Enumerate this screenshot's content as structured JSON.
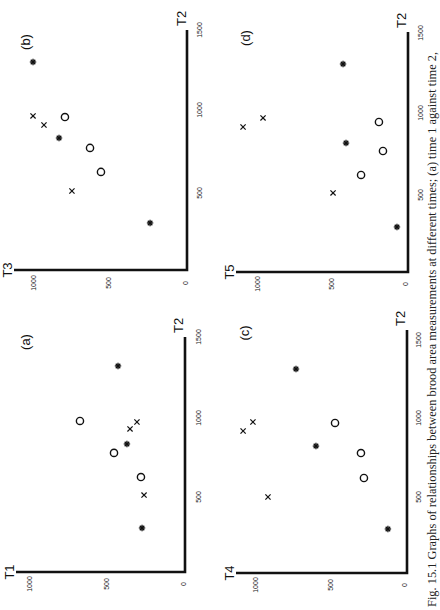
{
  "caption": "Fig. 15.1 Graphs of relationships between brood area measurements at different times; (a) time 1 against time 2,",
  "orientation": "page rotated 90 degrees counter-clockwise",
  "marker_legend": {
    "star": "asterisk marker",
    "cross": "x marker",
    "circle": "open circle marker"
  },
  "chart_data": [
    {
      "type": "scatter",
      "panel": "(a)",
      "title": "(a)",
      "xlabel": "T2",
      "ylabel": "T1",
      "xlim": [
        0,
        1500
      ],
      "ylim": [
        0,
        1000
      ],
      "xticks": [
        "0",
        "500",
        "1000",
        "1500"
      ],
      "yticks": [
        "0",
        "500",
        "1000"
      ],
      "grid": false,
      "series": [
        {
          "name": "star",
          "marker": "asterisk",
          "points": [
            [
              1315,
              435
            ],
            [
              817,
              377
            ],
            [
              281,
              279
            ]
          ]
        },
        {
          "name": "cross",
          "marker": "x",
          "points": [
            [
              957,
              312
            ],
            [
              913,
              357
            ],
            [
              491,
              266
            ]
          ]
        },
        {
          "name": "circle",
          "marker": "open-circle",
          "points": [
            [
              964,
              682
            ],
            [
              760,
              461
            ],
            [
              606,
              286
            ]
          ]
        }
      ]
    },
    {
      "type": "scatter",
      "panel": "(b)",
      "title": "(b)",
      "xlabel": "T2",
      "ylabel": "T3",
      "xlim": [
        0,
        1500
      ],
      "ylim": [
        0,
        1000
      ],
      "xticks": [
        "0",
        "500",
        "1000",
        "1500"
      ],
      "yticks": [
        "0",
        "500",
        "1000"
      ],
      "grid": false,
      "series": [
        {
          "name": "star",
          "marker": "asterisk",
          "points": [
            [
              1300,
              1013
            ],
            [
              825,
              842
            ],
            [
              294,
              243
            ]
          ]
        },
        {
          "name": "cross",
          "marker": "x",
          "points": [
            [
              963,
              1013
            ],
            [
              906,
              941
            ],
            [
              494,
              757
            ]
          ]
        },
        {
          "name": "circle",
          "marker": "open-circle",
          "points": [
            [
              956,
              803
            ],
            [
              763,
              638
            ],
            [
              613,
              566
            ]
          ]
        }
      ]
    },
    {
      "type": "scatter",
      "panel": "(c)",
      "title": "(c)",
      "xlabel": "T2",
      "ylabel": "T4",
      "xlim": [
        0,
        1500
      ],
      "ylim": [
        0,
        1000
      ],
      "xticks": [
        "0",
        "500",
        "1000",
        "1500"
      ],
      "yticks": [
        "0",
        "500",
        "1000"
      ],
      "grid": false,
      "series": [
        {
          "name": "star",
          "marker": "asterisk",
          "points": [
            [
              1316,
              745
            ],
            [
              819,
              611
            ],
            [
              284,
              128
            ]
          ]
        },
        {
          "name": "cross",
          "marker": "x",
          "points": [
            [
              916,
              1100
            ],
            [
              974,
              1034
            ],
            [
              490,
              933
            ]
          ]
        },
        {
          "name": "circle",
          "marker": "open-circle",
          "points": [
            [
              968,
              483
            ],
            [
              774,
              309
            ],
            [
              613,
              289
            ]
          ]
        }
      ]
    },
    {
      "type": "scatter",
      "panel": "(d)",
      "title": "(d)",
      "xlabel": "T2",
      "ylabel": "T5",
      "xlim": [
        0,
        1500
      ],
      "ylim": [
        0,
        1000
      ],
      "xticks": [
        "0",
        "500",
        "1000",
        "1500"
      ],
      "yticks": [
        "0",
        "500",
        "1000"
      ],
      "grid": false,
      "series": [
        {
          "name": "star",
          "marker": "asterisk",
          "points": [
            [
              1284,
              436
            ],
            [
              796,
              416
            ],
            [
              278,
              74
            ]
          ]
        },
        {
          "name": "cross",
          "marker": "x",
          "points": [
            [
              895,
              1107
            ],
            [
              951,
              973
            ],
            [
              488,
              503
            ]
          ]
        },
        {
          "name": "circle",
          "marker": "open-circle",
          "points": [
            [
              926,
              195
            ],
            [
              747,
              168
            ],
            [
              599,
              315
            ]
          ]
        }
      ]
    }
  ]
}
